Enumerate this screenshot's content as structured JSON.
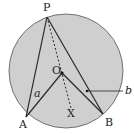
{
  "diagram": {
    "type": "circle-geometry",
    "colors": {
      "fill": "#cfcfcf",
      "stroke": "#2a2a2a",
      "background": "#ffffff"
    },
    "circle": {
      "center": "O"
    },
    "points": {
      "P": {
        "label": "P"
      },
      "A": {
        "label": "A"
      },
      "B": {
        "label": "B"
      },
      "O": {
        "label": "O"
      },
      "X": {
        "label": "X"
      }
    },
    "angle_labels": {
      "a": "a",
      "b": "b"
    },
    "segments": [
      "PA",
      "PB",
      "OA",
      "OB",
      "PX (dashed through O)"
    ]
  }
}
